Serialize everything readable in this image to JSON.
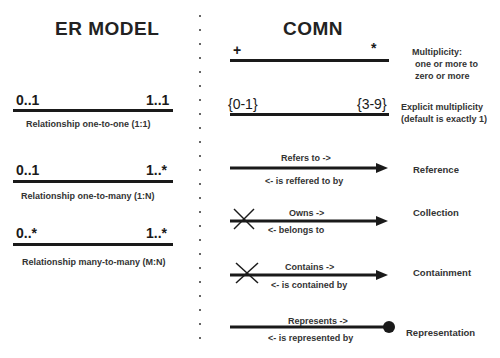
{
  "er_model": {
    "title": "ER MODEL",
    "rows": [
      {
        "left": "0..1",
        "right": "1..1",
        "caption": "Relationship one-to-one (1:1)"
      },
      {
        "left": "0..1",
        "right": "1..*",
        "caption": "Relationship one-to-many (1:N)"
      },
      {
        "left": "0..*",
        "right": "1..*",
        "caption": "Relationship many-to-many (M:N)"
      }
    ]
  },
  "comn": {
    "title": "COMN",
    "rows": [
      {
        "left": "+",
        "right": "*",
        "label_lines": [
          "Multiplicity:",
          " one or more to",
          " zero or more"
        ]
      },
      {
        "left": "{0-1}",
        "right": "{3-9}",
        "label_lines": [
          "Explicit multiplicity",
          "(default is exactly 1)"
        ]
      },
      {
        "forward": "Refers to ->",
        "backward": "<- is reffered to by",
        "label": "Reference",
        "end": "arrow"
      },
      {
        "forward": "Owns ->",
        "backward": "<- belongs to",
        "label": "Collection",
        "end": "arrow",
        "start": "x"
      },
      {
        "forward": "Contains ->",
        "backward": "<- is contained by",
        "label": "Containment",
        "end": "arrow",
        "start": "x"
      },
      {
        "forward": "Represents ->",
        "backward": "<- is represented by",
        "label": "Representation",
        "end": "dot"
      }
    ]
  }
}
